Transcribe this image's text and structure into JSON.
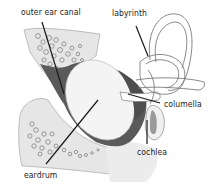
{
  "diagram": {
    "labels": {
      "outer_ear_canal": "outer ear canal",
      "labyrinth": "labyrinth",
      "columella": "columella",
      "cochlea": "cochlea",
      "eardrum": "eardrum"
    },
    "colors": {
      "tissue_light": "#e6e6e6",
      "cavity_dark": "#5a5a5a",
      "outline": "#8c8c8c",
      "leader_line": "#1a1a1a",
      "background": "#ffffff"
    }
  }
}
